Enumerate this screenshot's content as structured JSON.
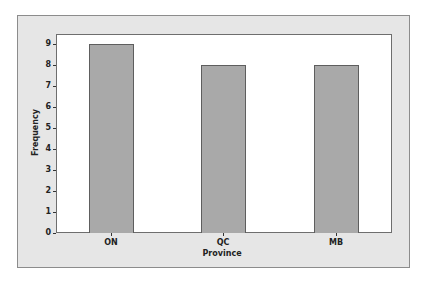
{
  "chart_data": {
    "type": "bar",
    "title": "",
    "xlabel": "Province",
    "ylabel": "Frequency",
    "categories": [
      "ON",
      "QC",
      "MB"
    ],
    "values": [
      9,
      8,
      8
    ],
    "ylim": [
      0,
      9.4
    ],
    "yticks": [
      0,
      1,
      2,
      3,
      4,
      5,
      6,
      7,
      8,
      9
    ],
    "grid": false,
    "legend": null,
    "colors": {
      "bar_fill": "#a9a9a9",
      "bar_edge": "#5e5e5e",
      "frame_bg": "#e6e6e6",
      "plot_bg": "#ffffff"
    }
  }
}
